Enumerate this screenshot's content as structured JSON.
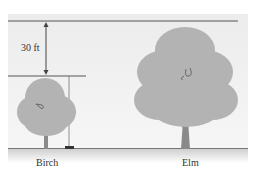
{
  "diagram": {
    "dimension_label": "30 ft",
    "trees": [
      {
        "name": "Birch"
      },
      {
        "name": "Elm"
      }
    ],
    "colors": {
      "foliage": "#b3b3b3",
      "trunk": "#8a8a8a",
      "line": "#555555",
      "background": "#eeeeee"
    }
  }
}
